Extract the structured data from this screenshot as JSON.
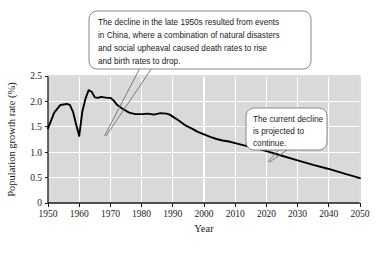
{
  "chart_data": {
    "type": "line",
    "title": "",
    "xlabel": "Year",
    "ylabel": "Population growth rate (%)",
    "xlim": [
      1950,
      2050
    ],
    "ylim": [
      0,
      2.5
    ],
    "xticks": [
      1950,
      1960,
      1970,
      1980,
      1990,
      2000,
      2010,
      2020,
      2030,
      2040,
      2050
    ],
    "yticks": [
      "0",
      "0.5",
      "1.0",
      "1.5",
      "2.0",
      "2.5"
    ],
    "ytick_values": [
      0,
      0.5,
      1.0,
      1.5,
      2.0,
      2.5
    ],
    "grid": true,
    "legend": "none",
    "series": [
      {
        "name": "World population growth rate",
        "x": [
          1950,
          1952,
          1954,
          1956,
          1957,
          1958,
          1959,
          1960,
          1961,
          1962,
          1963,
          1964,
          1965,
          1966,
          1967,
          1968,
          1969,
          1970,
          1971,
          1972,
          1974,
          1976,
          1978,
          1980,
          1982,
          1984,
          1986,
          1988,
          1989,
          1990,
          1992,
          1994,
          1996,
          1998,
          2000,
          2002,
          2004,
          2006,
          2008,
          2010,
          2015,
          2020,
          2025,
          2030,
          2035,
          2040,
          2045,
          2050
        ],
        "values": [
          1.47,
          1.78,
          1.93,
          1.95,
          1.93,
          1.8,
          1.55,
          1.32,
          1.8,
          2.05,
          2.22,
          2.19,
          2.08,
          2.07,
          2.09,
          2.08,
          2.07,
          2.07,
          2.02,
          1.94,
          1.85,
          1.78,
          1.75,
          1.75,
          1.76,
          1.74,
          1.77,
          1.76,
          1.74,
          1.7,
          1.62,
          1.53,
          1.47,
          1.4,
          1.35,
          1.3,
          1.26,
          1.23,
          1.21,
          1.18,
          1.1,
          1.02,
          0.93,
          0.84,
          0.75,
          0.67,
          0.58,
          0.49
        ]
      }
    ],
    "annotations": [
      {
        "id": "china-decline",
        "text": "The decline in the late 1950s resulted from events in China, where a combination of natural disasters and social upheaval caused death rates to rise and birth rates to drop.",
        "lines": [
          "The decline in the late 1950s resulted from events",
          "in China, where a combination of natural disasters",
          "and social upheaval caused death rates to rise",
          "and birth rates to drop."
        ],
        "points_to_year": 1960,
        "points_to_value": 1.32
      },
      {
        "id": "current-decline",
        "text": "The current decline is projected to continue.",
        "lines": [
          "The current decline",
          "is projected to",
          "continue."
        ],
        "points_to_year": 2026,
        "points_to_value": 0.92
      }
    ],
    "colors": {
      "plot_background": "#d9d9d9",
      "gridline": "#ffffff",
      "line": "#000000",
      "axis": "#1a1a1a",
      "callout_fill": "#ffffff",
      "callout_border": "#8a8a8a",
      "page_background": "#ffffff"
    }
  }
}
